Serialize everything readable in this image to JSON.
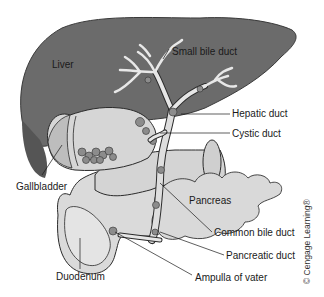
{
  "diagram": {
    "colors": {
      "liver": "#6b6b6b",
      "liver_dark": "#4f4f4f",
      "duct": "#dcdcdc",
      "organ_light": "#d8d8d8",
      "stone": "#8a8a8a",
      "outline": "#222222",
      "background": "#ffffff"
    },
    "labels": {
      "liver": "Liver",
      "small_bile_duct": "Small bile duct",
      "hepatic_duct": "Hepatic duct",
      "cystic_duct": "Cystic duct",
      "gallbladder": "Gallbladder",
      "pancreas": "Pancreas",
      "common_bile_duct": "Common bile duct",
      "pancreatic_duct": "Pancreatic duct",
      "duodenum": "Duodenum",
      "ampulla_of_vater": "Ampulla of vater"
    },
    "copyright": "© Cengage Learning®"
  }
}
